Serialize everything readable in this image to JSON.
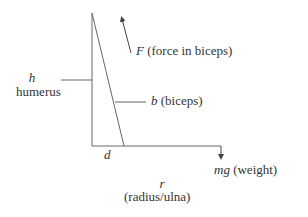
{
  "diagram": {
    "type": "free-body diagram of arm",
    "labels": {
      "force_symbol": "F",
      "force_desc": "(force in biceps)",
      "humerus_symbol": "h",
      "humerus_name": "humerus",
      "biceps_symbol": "b",
      "biceps_desc": "(biceps)",
      "d_symbol": "d",
      "weight_symbol": "mg",
      "weight_desc": "(weight)",
      "forearm_symbol": "r",
      "forearm_name": "(radius/ulna)"
    },
    "colors": {
      "line": "#555555",
      "text": "#333333"
    }
  }
}
